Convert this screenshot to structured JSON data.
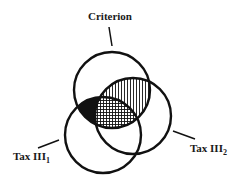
{
  "diagram": {
    "type": "venn",
    "sets": [
      {
        "id": "criterion",
        "label": "Criterion",
        "subscript": ""
      },
      {
        "id": "tax1",
        "label": "Tax III",
        "subscript": "1"
      },
      {
        "id": "tax2",
        "label": "Tax III",
        "subscript": "2"
      }
    ],
    "regions": [
      {
        "sets": [
          "criterion",
          "tax1"
        ],
        "fill": "solid-black"
      },
      {
        "sets": [
          "criterion",
          "tax2"
        ],
        "fill": "vertical-hatch"
      },
      {
        "sets": [
          "criterion",
          "tax1",
          "tax2"
        ],
        "fill": "cross-hatch"
      }
    ],
    "colors": {
      "stroke": "#111111",
      "background": "#ffffff"
    }
  }
}
